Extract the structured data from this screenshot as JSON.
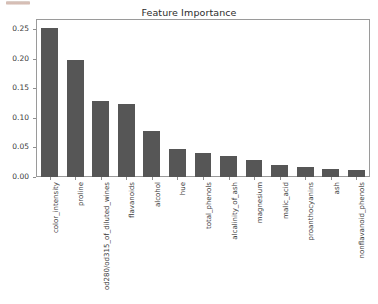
{
  "figure": {
    "width": 378,
    "height": 304,
    "background": "#ffffff",
    "bar_color": "#565656",
    "axis_color": "#9a9a9a",
    "text_color": "#3a3a3a"
  },
  "artifact": {
    "name": "cropped-ui-strip",
    "description": "faint reddish-tan strip at top-left edge"
  },
  "chart_data": {
    "type": "bar",
    "title": "Feature Importance",
    "xlabel": "",
    "ylabel": "",
    "grid": false,
    "legend": null,
    "ylim": [
      0.0,
      0.265
    ],
    "ytick_labels": [
      "0.00",
      "0.05",
      "0.10",
      "0.15",
      "0.20",
      "0.25"
    ],
    "ytick_values": [
      0.0,
      0.05,
      0.1,
      0.15,
      0.2,
      0.25
    ],
    "categories": [
      "color_intensity",
      "proline",
      "od280/od315_of_diluted_wines",
      "flavanoids",
      "alcohol",
      "hue",
      "total_phenols",
      "alcalinity_of_ash",
      "magnesium",
      "malic_acid",
      "proanthocyanins",
      "ash",
      "nonflavanoid_phenols"
    ],
    "values": [
      0.251,
      0.197,
      0.128,
      0.124,
      0.078,
      0.047,
      0.04,
      0.035,
      0.028,
      0.02,
      0.017,
      0.013,
      0.012
    ]
  }
}
